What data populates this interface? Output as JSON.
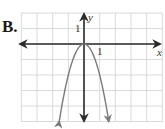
{
  "option": {
    "label": "B."
  },
  "chart_data": {
    "type": "line",
    "title": "",
    "function": "y = -2x^2",
    "xlabel": "x",
    "ylabel": "y",
    "xlim": [
      -4,
      5
    ],
    "ylim": [
      -5,
      2
    ],
    "grid": true,
    "grid_step": 1,
    "tick_labels": {
      "x": [
        "1"
      ],
      "y": [
        "1"
      ]
    },
    "series": [
      {
        "name": "parabola",
        "x": [
          -1.58,
          -1.5,
          -1.25,
          -1,
          -0.75,
          -0.5,
          -0.25,
          0,
          0.25,
          0.5,
          0.75,
          1,
          1.25,
          1.5,
          1.58
        ],
        "y": [
          -5,
          -4.5,
          -3.125,
          -2,
          -1.125,
          -0.5,
          -0.125,
          0,
          -0.125,
          -0.5,
          -1.125,
          -2,
          -3.125,
          -4.5,
          -5
        ],
        "vertex": [
          0,
          0
        ],
        "opens": "down",
        "arrows_at_ends": true
      }
    ],
    "legend": null
  },
  "colors": {
    "grid": "#d0d0d0",
    "axis": "#2a2a2a",
    "curve": "#7a7a7a"
  },
  "labels": {
    "x_axis": "x",
    "y_axis": "y",
    "x_tick_one": "1",
    "y_tick_one": "1"
  }
}
